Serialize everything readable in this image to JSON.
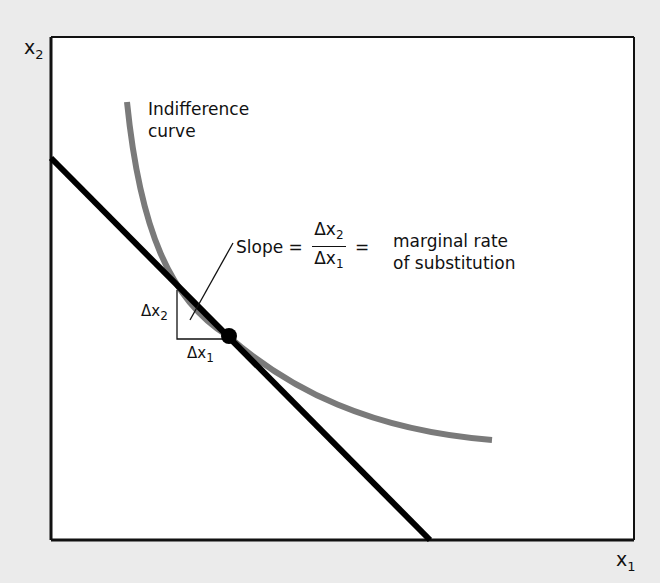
{
  "diagram": {
    "axes": {
      "y_label": "x",
      "y_label_sub": "2",
      "x_label": "x",
      "x_label_sub": "1"
    },
    "curve_label_line1": "Indifference",
    "curve_label_line2": "curve",
    "slope": {
      "prefix": "Slope =",
      "numerator": "Δx",
      "numerator_sub": "2",
      "denominator": "Δx",
      "denominator_sub": "1",
      "equals": "=",
      "description_line1": "marginal rate",
      "description_line2": "of substitution"
    },
    "triangle": {
      "dx2": "Δx",
      "dx2_sub": "2",
      "dx1": "Δx",
      "dx1_sub": "1"
    },
    "colors": {
      "background": "#ebebeb",
      "plot_area": "#ffffff",
      "budget_line": "#000000",
      "indifference_curve": "#7a7a7a"
    }
  }
}
